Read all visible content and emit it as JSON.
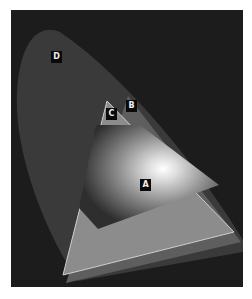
{
  "diagram": {
    "type": "color-gamut-comparison",
    "labels": {
      "a": "A",
      "b": "B",
      "c": "C",
      "d": "D"
    },
    "colors": {
      "background": "#1c1c1c",
      "region_d": "#3a3a3a",
      "region_b": "#6a6a6a",
      "region_c": "#8a8a8a",
      "region_a_center": "#ffffff"
    }
  }
}
